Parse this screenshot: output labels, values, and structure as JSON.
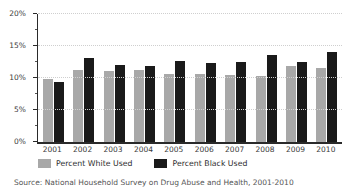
{
  "chart_data": {
    "type": "bar",
    "title": "",
    "xlabel": "",
    "ylabel": "",
    "categories": [
      "2001",
      "2002",
      "2003",
      "2004",
      "2005",
      "2006",
      "2007",
      "2008",
      "2009",
      "2010"
    ],
    "series": [
      {
        "name": "Percent White Used",
        "color": "#a8a8a8",
        "values": [
          9.8,
          11.2,
          11.1,
          11.2,
          10.6,
          10.6,
          10.4,
          10.3,
          11.8,
          11.6
        ]
      },
      {
        "name": "Percent Black Used",
        "color": "#1a1a1a",
        "values": [
          9.3,
          13.1,
          12.0,
          11.8,
          12.7,
          12.3,
          12.5,
          13.6,
          12.5,
          14.1
        ]
      }
    ],
    "ylim": [
      0,
      20
    ],
    "y_major_ticks": [
      0,
      5,
      10,
      15,
      20
    ],
    "y_minor_ticks": [
      2.5,
      7.5,
      12.5,
      17.5
    ],
    "y_tick_labels": [
      "0%",
      "5%",
      "10%",
      "15%",
      "20%"
    ],
    "grid": "horizontal dotted at major ticks",
    "legend_position": "bottom"
  },
  "legend": {
    "items": [
      {
        "label": "Percent White Used",
        "color": "#a8a8a8"
      },
      {
        "label": "Percent Black Used",
        "color": "#1a1a1a"
      }
    ]
  },
  "source_note": "Source: National Household Survey on Drug Abuse and Health, 2001-2010"
}
